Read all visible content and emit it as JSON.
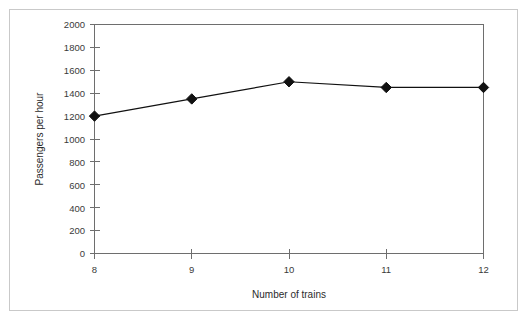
{
  "chart_data": {
    "type": "line",
    "title": "",
    "subtitle": "",
    "xlabel": "Number of trains",
    "ylabel": "Passengers per hour",
    "x": [
      8,
      9,
      10,
      11,
      12
    ],
    "values": [
      1200,
      1350,
      1500,
      1450,
      1450
    ],
    "series": [
      {
        "name": "Passengers per hour",
        "values": [
          1200,
          1350,
          1500,
          1450,
          1450
        ],
        "marker": "diamond",
        "color": "#111111"
      }
    ],
    "xlim": [
      8,
      12
    ],
    "ylim": [
      0,
      2000
    ],
    "x_tick_labels": [
      "8",
      "9",
      "10",
      "11",
      "12"
    ],
    "y_tick_labels": [
      "0",
      "200",
      "400",
      "600",
      "800",
      "1000",
      "1200",
      "1400",
      "1600",
      "1800",
      "2000"
    ],
    "y_ticks": [
      0,
      200,
      400,
      600,
      800,
      1000,
      1200,
      1400,
      1600,
      1800,
      2000
    ],
    "grid": false,
    "legend": false,
    "legend_position": "none",
    "axis_color": "#6e6e6e",
    "plot_border": "top-right-bottom-left-box",
    "annotations": []
  },
  "figure": {
    "border_color": "#c9c9c9",
    "background": "#ffffff"
  }
}
